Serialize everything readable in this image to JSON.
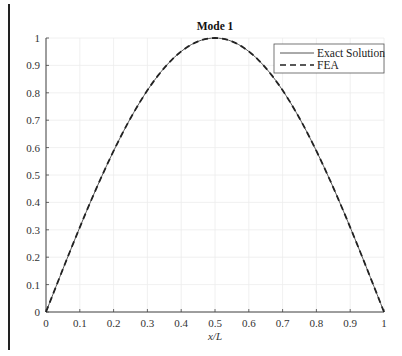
{
  "chart_data": {
    "type": "line",
    "title": "Mode 1",
    "xlabel": "x/L",
    "ylabel": "",
    "xlim": [
      0,
      1
    ],
    "ylim": [
      0,
      1
    ],
    "grid": true,
    "legend_position": "upper right",
    "x_ticks": [
      "0",
      "0.1",
      "0.2",
      "0.3",
      "0.4",
      "0.5",
      "0.6",
      "0.7",
      "0.8",
      "0.9",
      "1"
    ],
    "y_ticks": [
      "0",
      "0.1",
      "0.2",
      "0.3",
      "0.4",
      "0.5",
      "0.6",
      "0.7",
      "0.8",
      "0.9",
      "1"
    ],
    "x": [
      0,
      0.1,
      0.2,
      0.3,
      0.4,
      0.5,
      0.6,
      0.7,
      0.8,
      0.9,
      1.0
    ],
    "series": [
      {
        "name": "Exact Solution",
        "style": "solid",
        "color": "#555555",
        "values": [
          0,
          0.309,
          0.588,
          0.809,
          0.951,
          1.0,
          0.951,
          0.809,
          0.588,
          0.309,
          0
        ]
      },
      {
        "name": "FEA",
        "style": "dashed",
        "color": "#222222",
        "values": [
          0,
          0.309,
          0.588,
          0.809,
          0.951,
          1.0,
          0.951,
          0.809,
          0.588,
          0.309,
          0
        ]
      }
    ]
  },
  "legend": {
    "items": [
      "Exact Solution",
      "FEA"
    ]
  }
}
